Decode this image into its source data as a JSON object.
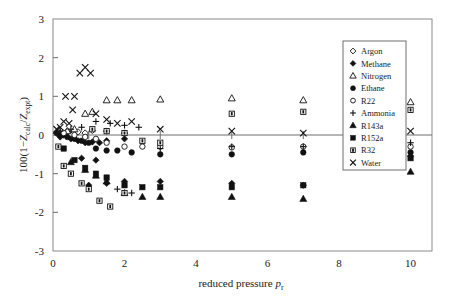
{
  "chart_data": {
    "type": "scatter",
    "title": "",
    "xlabel": "reduced pressure p r",
    "xlabel_main": "reduced pressure",
    "xlabel_var": "p",
    "xlabel_sub": "r",
    "ylabel": "100(1-Z calc / Z expt)",
    "ylabel_prefix": "100(1−",
    "ylabel_z1": "Z",
    "ylabel_sub1": "calc",
    "ylabel_slash": "/",
    "ylabel_z2": "Z",
    "ylabel_sub2": "expt",
    "ylabel_suffix": ")",
    "xlim": [
      0,
      10.6
    ],
    "ylim": [
      -3,
      3
    ],
    "xticks": [
      0,
      2,
      4,
      6,
      8,
      10
    ],
    "xtick_labels": [
      "0",
      "2",
      "4",
      "6",
      "8",
      "10"
    ],
    "xminorticks": [
      1,
      3,
      5,
      7,
      9
    ],
    "yticks": [
      -3,
      -2,
      -1,
      0,
      1,
      2,
      3
    ],
    "ytick_labels": [
      "-3",
      "-2",
      "-1",
      "0",
      "1",
      "2",
      "3"
    ],
    "grid": false,
    "zero_line": true,
    "legend_position": "top-right",
    "series": [
      {
        "name": "Argon",
        "marker": "open-diamond",
        "points": [
          [
            0.1,
            0.05
          ],
          [
            0.2,
            0.12
          ],
          [
            0.3,
            0.02
          ],
          [
            0.4,
            0.1
          ],
          [
            0.5,
            0.0
          ],
          [
            0.7,
            0.08
          ],
          [
            0.9,
            0.05
          ],
          [
            1.1,
            0.12
          ],
          [
            1.5,
            0.1
          ],
          [
            2.0,
            0.05
          ]
        ]
      },
      {
        "name": "Methane",
        "marker": "filled-diamond",
        "points": [
          [
            0.1,
            0.05
          ],
          [
            0.2,
            -0.05
          ],
          [
            0.3,
            0.0
          ],
          [
            0.5,
            -0.1
          ],
          [
            0.7,
            -0.15
          ],
          [
            0.9,
            -0.2
          ],
          [
            1.1,
            -0.18
          ],
          [
            1.3,
            -0.2
          ],
          [
            1.5,
            -0.15
          ],
          [
            2.0,
            -0.1
          ],
          [
            1.0,
            -1.3
          ],
          [
            1.5,
            -1.25
          ],
          [
            2.0,
            -1.2
          ],
          [
            3.0,
            -1.2
          ],
          [
            5.0,
            -1.25
          ],
          [
            7.0,
            -1.3
          ],
          [
            10.0,
            -0.55
          ],
          [
            0.8,
            -0.6
          ],
          [
            1.2,
            -0.65
          ]
        ]
      },
      {
        "name": "Nitrogen",
        "marker": "open-triangle",
        "points": [
          [
            0.2,
            0.05
          ],
          [
            0.4,
            0.1
          ],
          [
            0.6,
            0.15
          ],
          [
            0.9,
            0.55
          ],
          [
            1.1,
            0.6
          ],
          [
            1.5,
            0.9
          ],
          [
            1.8,
            0.9
          ],
          [
            2.2,
            0.9
          ],
          [
            3.0,
            0.92
          ],
          [
            5.0,
            0.95
          ],
          [
            7.0,
            0.9
          ],
          [
            10.0,
            0.85
          ]
        ]
      },
      {
        "name": "Ethane",
        "marker": "filled-circle",
        "points": [
          [
            0.2,
            0.0
          ],
          [
            0.4,
            -0.05
          ],
          [
            0.6,
            -0.1
          ],
          [
            0.8,
            -0.15
          ],
          [
            1.0,
            -0.2
          ],
          [
            1.2,
            -0.35
          ],
          [
            1.5,
            -0.4
          ],
          [
            1.8,
            -0.4
          ],
          [
            2.2,
            -0.45
          ],
          [
            3.0,
            -0.5
          ],
          [
            5.0,
            -0.5
          ],
          [
            7.0,
            -0.45
          ],
          [
            10.0,
            -0.45
          ]
        ]
      },
      {
        "name": "R22",
        "marker": "open-circle",
        "points": [
          [
            0.3,
            0.05
          ],
          [
            0.6,
            0.0
          ],
          [
            0.9,
            -0.05
          ],
          [
            1.2,
            -0.1
          ],
          [
            1.5,
            -0.2
          ],
          [
            2.0,
            -0.3
          ],
          [
            2.5,
            -0.3
          ],
          [
            3.0,
            -0.3
          ],
          [
            5.0,
            -0.32
          ],
          [
            7.0,
            -0.3
          ],
          [
            10.0,
            -0.3
          ]
        ]
      },
      {
        "name": "Ammonia",
        "marker": "plus",
        "points": [
          [
            0.2,
            0.1
          ],
          [
            0.5,
            0.15
          ],
          [
            0.8,
            0.2
          ],
          [
            1.2,
            0.35
          ],
          [
            1.6,
            0.3
          ],
          [
            2.0,
            0.25
          ],
          [
            2.4,
            0.2
          ],
          [
            3.0,
            -0.35
          ],
          [
            5.0,
            -0.3
          ],
          [
            7.0,
            -0.3
          ],
          [
            10.0,
            -0.2
          ],
          [
            1.8,
            -1.4
          ],
          [
            2.2,
            -1.5
          ]
        ]
      },
      {
        "name": "R143a",
        "marker": "filled-triangle",
        "points": [
          [
            0.5,
            -0.7
          ],
          [
            0.9,
            -0.9
          ],
          [
            1.2,
            -1.05
          ],
          [
            1.5,
            -1.2
          ],
          [
            2.0,
            -1.5
          ],
          [
            2.5,
            -1.6
          ],
          [
            3.0,
            -1.6
          ],
          [
            5.0,
            -1.6
          ],
          [
            7.0,
            -1.65
          ],
          [
            10.0,
            -0.95
          ]
        ]
      },
      {
        "name": "R152a",
        "marker": "filled-square",
        "points": [
          [
            0.3,
            -0.35
          ],
          [
            0.6,
            -0.65
          ],
          [
            0.9,
            -0.85
          ],
          [
            1.2,
            -1.0
          ],
          [
            1.5,
            -1.1
          ],
          [
            2.0,
            -1.3
          ],
          [
            2.5,
            -1.35
          ],
          [
            3.0,
            -1.35
          ],
          [
            5.0,
            -1.35
          ],
          [
            7.0,
            -1.3
          ],
          [
            10.0,
            -0.6
          ]
        ]
      },
      {
        "name": "R32",
        "marker": "open-square",
        "points": [
          [
            0.15,
            -0.3
          ],
          [
            0.3,
            -0.8
          ],
          [
            0.5,
            -1.0
          ],
          [
            0.8,
            -1.25
          ],
          [
            1.0,
            -1.4
          ],
          [
            1.3,
            -1.7
          ],
          [
            1.6,
            -1.85
          ],
          [
            2.0,
            -1.5
          ],
          [
            1.1,
            0.15
          ],
          [
            1.5,
            0.1
          ],
          [
            2.0,
            0.05
          ],
          [
            2.5,
            -0.15
          ],
          [
            3.0,
            -0.2
          ],
          [
            5.0,
            0.55
          ],
          [
            7.0,
            0.6
          ],
          [
            10.0,
            0.65
          ]
        ]
      },
      {
        "name": "Water",
        "marker": "cross",
        "points": [
          [
            0.1,
            0.15
          ],
          [
            0.2,
            0.2
          ],
          [
            0.3,
            0.35
          ],
          [
            0.45,
            0.3
          ],
          [
            0.6,
            1.0
          ],
          [
            0.75,
            1.6
          ],
          [
            0.9,
            1.75
          ],
          [
            1.05,
            1.6
          ],
          [
            1.2,
            0.55
          ],
          [
            1.5,
            0.4
          ],
          [
            1.8,
            0.3
          ],
          [
            2.2,
            0.35
          ],
          [
            3.0,
            0.15
          ],
          [
            5.0,
            0.1
          ],
          [
            7.0,
            0.05
          ],
          [
            10.0,
            0.1
          ],
          [
            0.35,
            1.0
          ],
          [
            0.55,
            0.65
          ]
        ]
      }
    ],
    "legend": [
      {
        "label": "Argon",
        "marker": "open-diamond"
      },
      {
        "label": "Methane",
        "marker": "filled-diamond"
      },
      {
        "label": "Nitrogen",
        "marker": "open-triangle"
      },
      {
        "label": "Ethane",
        "marker": "filled-circle"
      },
      {
        "label": "R22",
        "marker": "open-circle"
      },
      {
        "label": "Ammonia",
        "marker": "plus"
      },
      {
        "label": "R143a",
        "marker": "filled-triangle"
      },
      {
        "label": "R152a",
        "marker": "filled-square"
      },
      {
        "label": "R32",
        "marker": "open-square"
      },
      {
        "label": "Water",
        "marker": "cross"
      }
    ],
    "colors": {
      "marker": "#111111",
      "axis": "#6e6e6e",
      "frame": "#8a8a8a",
      "background": "#ffffff"
    }
  }
}
